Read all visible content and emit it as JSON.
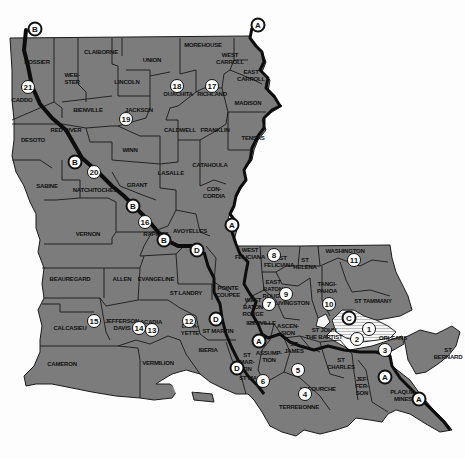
{
  "map": {
    "title": "Louisiana parishes with route markers",
    "colors": {
      "parish_fill": "#7c7c7c",
      "border": "#1a1a1a",
      "river": "#0d0d0d",
      "lake_fill": "#f4f4f4",
      "marker_fill": "#ffffff"
    },
    "parishes": [
      {
        "name": "BOSSIER",
        "x": 37,
        "y": 62
      },
      {
        "name": "CADDO",
        "x": 22,
        "y": 100
      },
      {
        "name": "CLAIBORNE",
        "x": 101,
        "y": 52
      },
      {
        "name": "WEB-\nSTER",
        "x": 72,
        "y": 79
      },
      {
        "name": "UNION",
        "x": 152,
        "y": 60
      },
      {
        "name": "MOREHOUSE",
        "x": 203,
        "y": 45
      },
      {
        "name": "WEST\nCARROLL",
        "x": 230,
        "y": 59
      },
      {
        "name": "EAST\nCARROLL",
        "x": 251,
        "y": 76
      },
      {
        "name": "LINCOLN",
        "x": 127,
        "y": 82
      },
      {
        "name": "OUACHITA",
        "x": 178,
        "y": 94
      },
      {
        "name": "RICHLAND",
        "x": 212,
        "y": 94
      },
      {
        "name": "MADISON",
        "x": 248,
        "y": 103
      },
      {
        "name": "BIENVILLE",
        "x": 88,
        "y": 110
      },
      {
        "name": "JACKSON",
        "x": 139,
        "y": 110
      },
      {
        "name": "DESOTO",
        "x": 33,
        "y": 140
      },
      {
        "name": "RED RIVER",
        "x": 66,
        "y": 130
      },
      {
        "name": "CALDWELL",
        "x": 180,
        "y": 130
      },
      {
        "name": "FRANKLIN",
        "x": 215,
        "y": 130
      },
      {
        "name": "TENSAS",
        "x": 253,
        "y": 138
      },
      {
        "name": "WINN",
        "x": 130,
        "y": 150
      },
      {
        "name": "CATAHOULA",
        "x": 210,
        "y": 165
      },
      {
        "name": "LASALLE",
        "x": 171,
        "y": 173
      },
      {
        "name": "SABINE",
        "x": 47,
        "y": 186
      },
      {
        "name": "NATCHITOCHES",
        "x": 95,
        "y": 190
      },
      {
        "name": "GRANT",
        "x": 137,
        "y": 185
      },
      {
        "name": "CON-\nCORDIA",
        "x": 214,
        "y": 193
      },
      {
        "name": "VERNON",
        "x": 88,
        "y": 234
      },
      {
        "name": "RAPIDES",
        "x": 156,
        "y": 234
      },
      {
        "name": "AVOYELLES",
        "x": 190,
        "y": 231
      },
      {
        "name": "WEST\nFELICIANA",
        "x": 250,
        "y": 254
      },
      {
        "name": "EAST\nFELICIANA",
        "x": 279,
        "y": 262
      },
      {
        "name": "ST\nHELENA",
        "x": 305,
        "y": 264
      },
      {
        "name": "WASHINGTON",
        "x": 345,
        "y": 251
      },
      {
        "name": "BEAUREGARD",
        "x": 70,
        "y": 279
      },
      {
        "name": "ALLEN",
        "x": 122,
        "y": 279
      },
      {
        "name": "EVANGELINE",
        "x": 156,
        "y": 279
      },
      {
        "name": "POINTE\nCOUPEE",
        "x": 228,
        "y": 292
      },
      {
        "name": "EAST\nBATON\nROUGE",
        "x": 273,
        "y": 289
      },
      {
        "name": "ST LANDRY",
        "x": 186,
        "y": 293
      },
      {
        "name": "TANGI-\nPAHOA",
        "x": 327,
        "y": 288
      },
      {
        "name": "ST TAMMANY",
        "x": 373,
        "y": 301
      },
      {
        "name": "WEST\nBATON\nROUGE",
        "x": 253,
        "y": 307
      },
      {
        "name": "LIVINGSTON",
        "x": 292,
        "y": 303
      },
      {
        "name": "CALCASIEU",
        "x": 70,
        "y": 328
      },
      {
        "name": "JEFFERSON\nDAVIS",
        "x": 122,
        "y": 325
      },
      {
        "name": "ACADIA",
        "x": 151,
        "y": 322
      },
      {
        "name": "LAFA-\nYETTE",
        "x": 190,
        "y": 330
      },
      {
        "name": "ST MARTIN",
        "x": 218,
        "y": 331
      },
      {
        "name": "IBERVILLE",
        "x": 261,
        "y": 323
      },
      {
        "name": "ASCEN-\nSION",
        "x": 288,
        "y": 330
      },
      {
        "name": "ST JOHN\nTHE BAPTIST",
        "x": 324,
        "y": 334
      },
      {
        "name": "ORLEANS",
        "x": 393,
        "y": 338
      },
      {
        "name": "ST\nJAMES",
        "x": 294,
        "y": 348
      },
      {
        "name": "IBERIA",
        "x": 208,
        "y": 350
      },
      {
        "name": "ASSUMP-\nTION",
        "x": 269,
        "y": 357
      },
      {
        "name": "ST\nMAR-\nTIN",
        "x": 247,
        "y": 362
      },
      {
        "name": "CAMERON",
        "x": 62,
        "y": 364
      },
      {
        "name": "VERMILION",
        "x": 158,
        "y": 363
      },
      {
        "name": "ST MARY",
        "x": 252,
        "y": 378
      },
      {
        "name": "ST\nCHARLES",
        "x": 341,
        "y": 364
      },
      {
        "name": "ST\nBERNARD",
        "x": 455,
        "y": 354
      },
      {
        "name": "JEF-\nFER-\nSON",
        "x": 362,
        "y": 386
      },
      {
        "name": "LAFOURCHE",
        "x": 318,
        "y": 389
      },
      {
        "name": "PLAQUE-\nMINES",
        "x": 403,
        "y": 396
      },
      {
        "name": "TERREBONNE",
        "x": 299,
        "y": 407
      }
    ],
    "number_markers": [
      {
        "label": "1",
        "x": 369,
        "y": 329
      },
      {
        "label": "2",
        "x": 357,
        "y": 339
      },
      {
        "label": "3",
        "x": 385,
        "y": 350
      },
      {
        "label": "4",
        "x": 305,
        "y": 394
      },
      {
        "label": "5",
        "x": 298,
        "y": 370
      },
      {
        "label": "6",
        "x": 263,
        "y": 381
      },
      {
        "label": "7",
        "x": 269,
        "y": 304
      },
      {
        "label": "8",
        "x": 274,
        "y": 255
      },
      {
        "label": "9",
        "x": 286,
        "y": 294
      },
      {
        "label": "10",
        "x": 329,
        "y": 304
      },
      {
        "label": "11",
        "x": 354,
        "y": 260
      },
      {
        "label": "12",
        "x": 189,
        "y": 321
      },
      {
        "label": "13",
        "x": 152,
        "y": 330
      },
      {
        "label": "14",
        "x": 139,
        "y": 328
      },
      {
        "label": "15",
        "x": 94,
        "y": 321
      },
      {
        "label": "16",
        "x": 145,
        "y": 222
      },
      {
        "label": "17",
        "x": 212,
        "y": 86
      },
      {
        "label": "18",
        "x": 177,
        "y": 86
      },
      {
        "label": "19",
        "x": 126,
        "y": 119
      },
      {
        "label": "20",
        "x": 94,
        "y": 172
      },
      {
        "label": "21",
        "x": 28,
        "y": 87
      }
    ],
    "letter_markers": [
      {
        "label": "B",
        "x": 35,
        "y": 29
      },
      {
        "label": "A",
        "x": 258,
        "y": 25
      },
      {
        "label": "B",
        "x": 75,
        "y": 162
      },
      {
        "label": "B",
        "x": 133,
        "y": 206
      },
      {
        "label": "B",
        "x": 164,
        "y": 240
      },
      {
        "label": "D",
        "x": 197,
        "y": 250
      },
      {
        "label": "A",
        "x": 232,
        "y": 225
      },
      {
        "label": "D",
        "x": 216,
        "y": 319
      },
      {
        "label": "A",
        "x": 259,
        "y": 341
      },
      {
        "label": "D",
        "x": 237,
        "y": 368
      },
      {
        "label": "C",
        "x": 349,
        "y": 318
      },
      {
        "label": "A",
        "x": 385,
        "y": 377
      },
      {
        "label": "A",
        "x": 419,
        "y": 399
      }
    ]
  }
}
